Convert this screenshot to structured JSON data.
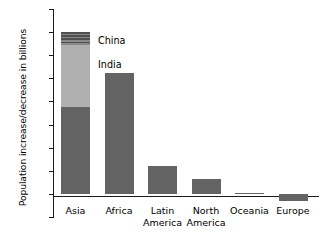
{
  "chart_data": {
    "type": "bar",
    "title": "",
    "xlabel": "",
    "ylabel": "Population increase/decrease in billions",
    "ylim": [
      -0.2,
      1.6
    ],
    "yticks": [
      "1.6",
      "1.4",
      "1.2",
      "1.0",
      "0.8",
      "0.6",
      "0.4",
      "0.2",
      "0",
      "-0.2"
    ],
    "ytick_values": [
      1.6,
      1.4,
      1.2,
      1.0,
      0.8,
      0.6,
      0.4,
      0.2,
      0,
      -0.2
    ],
    "grid": false,
    "legend_position": "inline-annotation",
    "categories": [
      "Asia",
      "Latin America",
      "North America",
      "Oceania",
      "Europe",
      "Africa"
    ],
    "bars": [
      {
        "category": "Asia",
        "label_line1": "Asia",
        "label_line2": "",
        "total": 1.4,
        "stacked": true,
        "segments": [
          {
            "name": "Rest of Asia",
            "value": 0.75,
            "start": 0,
            "end": 0.75,
            "style": "solid-dark"
          },
          {
            "name": "India",
            "value": 0.54,
            "start": 0.75,
            "end": 1.29,
            "style": "solid-light"
          },
          {
            "name": "China",
            "value": 0.11,
            "start": 1.29,
            "end": 1.4,
            "style": "hatched"
          }
        ]
      },
      {
        "category": "Africa",
        "label_line1": "Africa",
        "label_line2": "",
        "total": 1.05,
        "stacked": false,
        "segments": [
          {
            "name": "Africa",
            "value": 1.05,
            "start": 0,
            "end": 1.05,
            "style": "solid-dark"
          }
        ]
      },
      {
        "category": "Latin America",
        "label_line1": "Latin",
        "label_line2": "America",
        "total": 0.24,
        "stacked": false,
        "segments": [
          {
            "name": "Latin America",
            "value": 0.24,
            "start": 0,
            "end": 0.24,
            "style": "solid-dark"
          }
        ]
      },
      {
        "category": "North America",
        "label_line1": "North",
        "label_line2": "America",
        "total": 0.13,
        "stacked": false,
        "segments": [
          {
            "name": "North America",
            "value": 0.13,
            "start": 0,
            "end": 0.13,
            "style": "solid-dark"
          }
        ]
      },
      {
        "category": "Oceania",
        "label_line1": "Oceania",
        "label_line2": "",
        "total": 0.01,
        "stacked": false,
        "segments": [
          {
            "name": "Oceania",
            "value": 0.01,
            "start": 0,
            "end": 0.01,
            "style": "solid-dark"
          }
        ]
      },
      {
        "category": "Europe",
        "label_line1": "Europe",
        "label_line2": "",
        "total": -0.06,
        "stacked": false,
        "segments": [
          {
            "name": "Europe",
            "value": -0.06,
            "start": 0,
            "end": -0.06,
            "style": "solid-dark"
          }
        ]
      }
    ],
    "annotations": [
      {
        "text": "China",
        "target": "Asia.China"
      },
      {
        "text": "India",
        "target": "Asia.India"
      }
    ],
    "colors": {
      "solid_dark": "#636363",
      "solid_light": "#b0b0b0",
      "hatch_dark": "#4f4f4f",
      "hatch_light": "#8a8a8a",
      "axis": "#1a1a1a",
      "text": "#000000",
      "background": "#ffffff"
    }
  }
}
